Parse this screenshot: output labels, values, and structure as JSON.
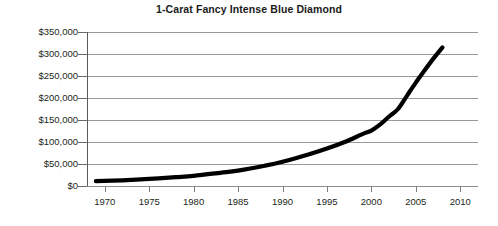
{
  "chart_data": {
    "type": "line",
    "title": "1-Carat Fancy Intense Blue Diamond",
    "xlabel": "",
    "ylabel": "",
    "xlim": [
      1968,
      2012
    ],
    "ylim": [
      0,
      350000
    ],
    "grid": true,
    "legend": false,
    "legend_position": "none",
    "line_color": "#000000",
    "grid_color": "#9a9a9a",
    "y_tick_labels": [
      "$350,000",
      "$300,000",
      "$250,000",
      "$200,000",
      "$150,000",
      "$100,000",
      "$50,000",
      "$0"
    ],
    "y_tick_values": [
      350000,
      300000,
      250000,
      200000,
      150000,
      100000,
      50000,
      0
    ],
    "x_tick_labels": [
      "1970",
      "1975",
      "1980",
      "1985",
      "1990",
      "1995",
      "2000",
      "2005",
      "2010"
    ],
    "x_tick_values": [
      1970,
      1975,
      1980,
      1985,
      1990,
      1995,
      2000,
      2005,
      2010
    ],
    "series": [
      {
        "name": "1-Carat Fancy Intense Blue Diamond price",
        "x": [
          1969,
          1972,
          1975,
          1978,
          1980,
          1983,
          1985,
          1988,
          1990,
          1993,
          1995,
          1997,
          1999,
          2000,
          2001,
          2002,
          2003,
          2004,
          2005,
          2006,
          2007,
          2008
        ],
        "values": [
          11000,
          13000,
          16000,
          20000,
          23000,
          30000,
          35000,
          46000,
          55000,
          72000,
          85000,
          100000,
          118000,
          126000,
          140000,
          158000,
          175000,
          205000,
          235000,
          263000,
          290000,
          315000
        ]
      }
    ]
  }
}
